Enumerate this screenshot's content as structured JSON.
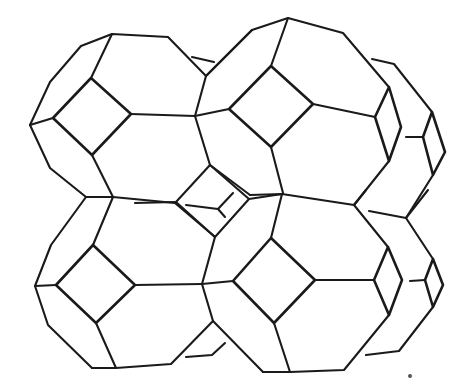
{
  "figure": {
    "title": "Sodalite-type framework of truncated octahedral cages",
    "stroke_color": "#1a1a1a",
    "background": "#ffffff",
    "cages": [
      {
        "id": "top-left",
        "label": "truncated octahedron (top-left)"
      },
      {
        "id": "top-right",
        "label": "truncated octahedron (top-right)"
      },
      {
        "id": "bottom-left",
        "label": "truncated octahedron (bottom-left)"
      },
      {
        "id": "bottom-right",
        "label": "truncated octahedron (bottom-right)"
      },
      {
        "id": "central-cube",
        "label": "central square face with Y-junction"
      }
    ]
  }
}
